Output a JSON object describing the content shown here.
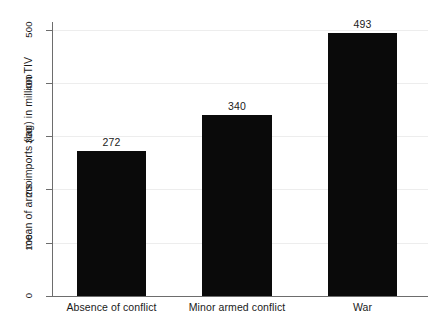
{
  "chart_data": {
    "type": "bar",
    "title": "",
    "subtitle": "",
    "xlabel": "",
    "ylabel": "mean of arms imports (lag) in million TIV",
    "categories": [
      "Absence of conflict",
      "Minor armed conflict",
      "War"
    ],
    "values": [
      272,
      340,
      493
    ],
    "value_labels": [
      "272",
      "340",
      "493"
    ],
    "ylim": [
      0,
      500
    ],
    "yticks": [
      0,
      100,
      200,
      300,
      400,
      500
    ],
    "ytick_labels": [
      "0",
      "100",
      "200",
      "300",
      "400",
      "500"
    ],
    "grid": "horizontal",
    "legend": "none",
    "bar_color": "#0a0a0a",
    "background_color": "#ffffff",
    "axis_color": "#6d6d6d",
    "gridline_color": "#ededed",
    "annotations": []
  },
  "axis": {
    "y_title": "mean of arms imports (lag) in million TIV"
  }
}
